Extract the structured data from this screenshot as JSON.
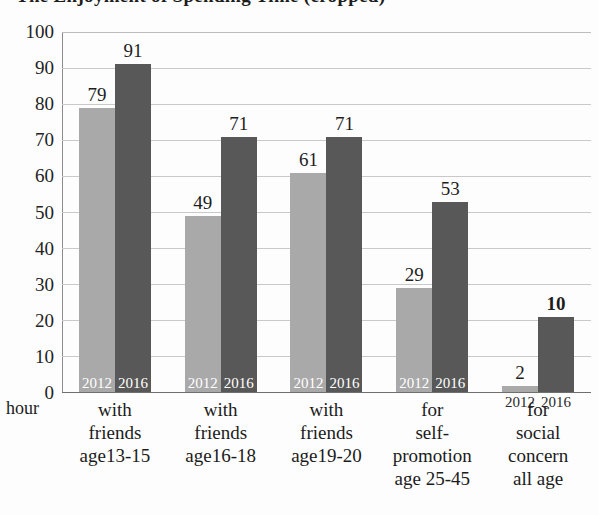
{
  "title": "The Enjoyment of Spending Time (cropped)",
  "axis_unit_label": "hour",
  "series_tags": {
    "a": "2012",
    "b": "2016"
  },
  "yticks": [
    "100",
    "90",
    "80",
    "70",
    "60",
    "50",
    "40",
    "30",
    "20",
    "10",
    "0"
  ],
  "colors": {
    "series_2012": "#a9a9a9",
    "series_2016": "#585858",
    "gridline": "#c9c9c9",
    "axis": "#6f6f6f",
    "text": "#1d1d1d",
    "inbar_text": "#ffffff"
  },
  "categories": [
    {
      "lines": [
        "with",
        "friends",
        "age13-15"
      ]
    },
    {
      "lines": [
        "with",
        "friends",
        "age16-18"
      ]
    },
    {
      "lines": [
        "with",
        "friends",
        "age19-20"
      ]
    },
    {
      "lines": [
        "for",
        "self-",
        "promotion",
        "age 25-45"
      ]
    },
    {
      "lines": [
        "for",
        "social",
        "concern",
        "all age"
      ]
    }
  ],
  "bars": [
    {
      "tag": "2012",
      "value": "79",
      "value_num": 79,
      "draw": 79,
      "bold": false,
      "tag_outside": false
    },
    {
      "tag": "2016",
      "value": "91",
      "value_num": 91,
      "draw": 91,
      "bold": false,
      "tag_outside": false
    },
    {
      "tag": "2012",
      "value": "49",
      "value_num": 49,
      "draw": 49,
      "bold": false,
      "tag_outside": false
    },
    {
      "tag": "2016",
      "value": "71",
      "value_num": 71,
      "draw": 71,
      "bold": false,
      "tag_outside": false
    },
    {
      "tag": "2012",
      "value": "61",
      "value_num": 61,
      "draw": 61,
      "bold": false,
      "tag_outside": false
    },
    {
      "tag": "2016",
      "value": "71",
      "value_num": 71,
      "draw": 71,
      "bold": false,
      "tag_outside": false
    },
    {
      "tag": "2012",
      "value": "29",
      "value_num": 29,
      "draw": 29,
      "bold": false,
      "tag_outside": false
    },
    {
      "tag": "2016",
      "value": "53",
      "value_num": 53,
      "draw": 53,
      "bold": false,
      "tag_outside": false
    },
    {
      "tag": "2012",
      "value": "2",
      "value_num": 2,
      "draw": 2,
      "bold": false,
      "tag_outside": true
    },
    {
      "tag": "2016",
      "value": "10",
      "value_num": 10,
      "draw": 21,
      "bold": true,
      "tag_outside": true
    }
  ],
  "chart_data": {
    "type": "bar",
    "xlabel": "hour",
    "ylabel": "",
    "ylim": [
      0,
      100
    ],
    "ytick_step": 10,
    "grid": true,
    "legend": "in-bar labels (2012 / 2016), no separate legend box",
    "categories": [
      "with friends age13-15",
      "with friends age16-18",
      "with friends age19-20",
      "for self-promotion age 25-45",
      "for social concern all age"
    ],
    "series": [
      {
        "name": "2012",
        "color": "#a9a9a9",
        "values": [
          79,
          49,
          61,
          29,
          2
        ]
      },
      {
        "name": "2016",
        "color": "#585858",
        "values": [
          91,
          71,
          71,
          53,
          10
        ]
      }
    ]
  }
}
